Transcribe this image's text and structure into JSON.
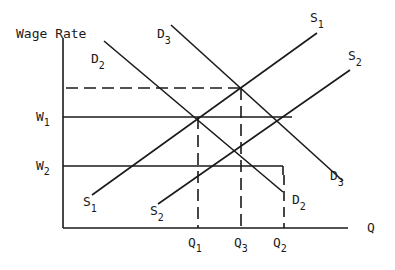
{
  "diagram": {
    "axes": {
      "y_label": "Wage Rate",
      "x_label": "Q"
    },
    "wage_levels": [
      {
        "label": "W",
        "sub": "1"
      },
      {
        "label": "W",
        "sub": "2"
      }
    ],
    "quantity_levels": [
      {
        "label": "Q",
        "sub": "1"
      },
      {
        "label": "Q",
        "sub": "3"
      },
      {
        "label": "Q",
        "sub": "2"
      }
    ],
    "curves": {
      "S1": {
        "label": "S",
        "sub": "1"
      },
      "S2": {
        "label": "S",
        "sub": "2"
      },
      "D2": {
        "label": "D",
        "sub": "2"
      },
      "D3": {
        "label": "D",
        "sub": "3"
      }
    },
    "colors": {
      "line": "#1a1a1a",
      "background": "#ffffff"
    }
  }
}
